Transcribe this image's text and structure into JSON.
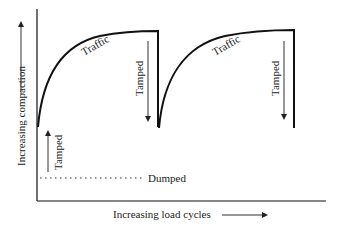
{
  "diagram": {
    "title": "",
    "y_axis_label": "Increasing compaction",
    "x_axis_label": "Increasing load cycles",
    "curves": [
      {
        "label": "Traffic",
        "start": [
          38,
          127
        ],
        "end": [
          158,
          31
        ]
      },
      {
        "label": "Traffic",
        "start": [
          159,
          128
        ],
        "end": [
          294,
          30
        ]
      }
    ],
    "annotations": [
      {
        "label": "Tamped",
        "direction": "up",
        "position": "initial"
      },
      {
        "label": "Tamped",
        "direction": "down",
        "position": "after-first-traffic"
      },
      {
        "label": "Tamped",
        "direction": "down",
        "position": "after-second-traffic"
      },
      {
        "label": "Dumped",
        "style": "dotted-line",
        "position": "baseline"
      }
    ],
    "colors": {
      "line": "#111111",
      "arrow": "#333333",
      "text": "#222222",
      "background": "#ffffff"
    }
  },
  "labels": {
    "y_axis": "Increasing compaction",
    "x_axis": "Increasing load cycles",
    "traffic_1": "Traffic",
    "traffic_2": "Traffic",
    "tamped_up": "Tamped",
    "tamped_down_1": "Tamped",
    "tamped_down_2": "Tamped",
    "dumped": "Dumped"
  }
}
